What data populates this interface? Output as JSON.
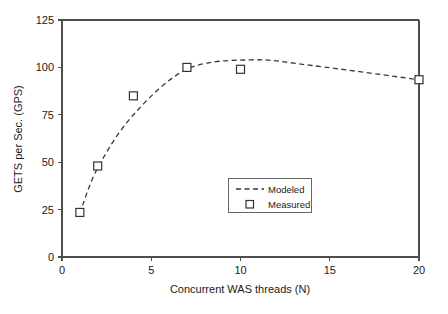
{
  "chart_data": {
    "type": "line",
    "title": "",
    "xlabel": "Concurrent WAS threads (N)",
    "ylabel": "GETS per Sec. (GPS)",
    "xlim": [
      0,
      20
    ],
    "ylim": [
      0,
      125
    ],
    "xticks": [
      "0",
      "5",
      "10",
      "15",
      "20"
    ],
    "xtick_values": [
      0,
      5,
      10,
      15,
      20
    ],
    "yticks": [
      "0",
      "25",
      "50",
      "75",
      "100",
      "125"
    ],
    "ytick_values": [
      0,
      25,
      50,
      75,
      100,
      125
    ],
    "grid": false,
    "legend_position": "center-right-inside",
    "series": [
      {
        "name": "Modeled",
        "style": "dashed-line",
        "x": [
          1,
          2,
          4,
          7,
          10.6,
          14,
          20
        ],
        "values": [
          23,
          47,
          75,
          99,
          104,
          101,
          93.5
        ]
      },
      {
        "name": "Measured",
        "style": "open-square-marker",
        "x": [
          1,
          2,
          4,
          7,
          10,
          20
        ],
        "values": [
          23.5,
          48,
          85,
          100,
          99,
          93.5
        ]
      }
    ]
  },
  "legend": {
    "items": [
      {
        "label": "Modeled",
        "symbol": "dashed-line"
      },
      {
        "label": "Measured",
        "symbol": "open-square"
      }
    ]
  },
  "colors": {
    "axis": "#4d4d4d",
    "line": "#3a3a3a",
    "marker_stroke": "#333333",
    "marker_fill": "#ffffff",
    "background": "#ffffff",
    "text": "#1a1a1a"
  }
}
